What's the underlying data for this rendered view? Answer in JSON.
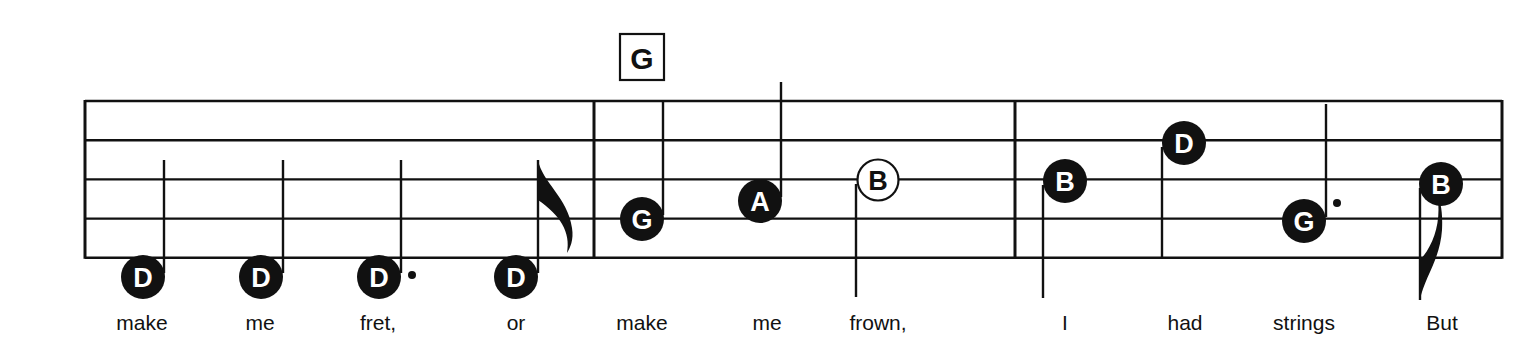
{
  "sheet": {
    "staff": {
      "top": 101,
      "spacing": 39.2,
      "lines": 5,
      "left": 85,
      "right": 1502,
      "color": "#111111"
    },
    "barlines": [
      85,
      594,
      1015,
      1502
    ],
    "chord_symbols": [
      {
        "label": "G",
        "x": 642,
        "y": 58
      }
    ],
    "notes": [
      {
        "letter": "D",
        "x": 143,
        "y": 277,
        "filled": true,
        "stem": "up",
        "stem_x": 164,
        "stem_end": 160,
        "dot": false,
        "flag": false,
        "lyric": "make",
        "lyric_x": 142
      },
      {
        "letter": "D",
        "x": 261,
        "y": 277,
        "filled": true,
        "stem": "up",
        "stem_x": 283,
        "stem_end": 160,
        "dot": false,
        "flag": false,
        "lyric": "me",
        "lyric_x": 260
      },
      {
        "letter": "D",
        "x": 379,
        "y": 277,
        "filled": true,
        "stem": "up",
        "stem_x": 401,
        "stem_end": 160,
        "dot": true,
        "flag": false,
        "lyric": "fret,",
        "lyric_x": 378
      },
      {
        "letter": "D",
        "x": 516,
        "y": 277,
        "filled": true,
        "stem": "up",
        "stem_x": 538,
        "stem_end": 160,
        "dot": false,
        "flag": true,
        "lyric": "or",
        "lyric_x": 516
      },
      {
        "letter": "G",
        "x": 642,
        "y": 219,
        "filled": true,
        "stem": "up",
        "stem_x": 663,
        "stem_end": 102,
        "dot": false,
        "flag": false,
        "lyric": "make",
        "lyric_x": 642
      },
      {
        "letter": "A",
        "x": 760,
        "y": 201,
        "filled": true,
        "stem": "up",
        "stem_x": 781,
        "stem_end": 82,
        "dot": false,
        "flag": false,
        "lyric": "me",
        "lyric_x": 767
      },
      {
        "letter": "B",
        "x": 878,
        "y": 180,
        "filled": false,
        "stem": "down",
        "stem_x": 856,
        "stem_end": 297,
        "dot": false,
        "flag": false,
        "lyric": "frown,",
        "lyric_x": 878
      },
      {
        "letter": "B",
        "x": 1065,
        "y": 181,
        "filled": true,
        "stem": "down",
        "stem_x": 1043,
        "stem_end": 298,
        "dot": false,
        "flag": false,
        "lyric": "I",
        "lyric_x": 1065
      },
      {
        "letter": "D",
        "x": 1184,
        "y": 143,
        "filled": true,
        "stem": "down",
        "stem_x": 1162,
        "stem_end": 258,
        "dot": false,
        "flag": false,
        "lyric": "had",
        "lyric_x": 1185
      },
      {
        "letter": "G",
        "x": 1304,
        "y": 221,
        "filled": true,
        "stem": "up",
        "stem_x": 1326,
        "stem_end": 104,
        "dot": true,
        "flag": false,
        "lyric": "strings",
        "lyric_x": 1304
      },
      {
        "letter": "B",
        "x": 1441,
        "y": 184,
        "filled": true,
        "stem": "down",
        "stem_x": 1420,
        "stem_end": 300,
        "dot": false,
        "flag": true,
        "lyric": "But",
        "lyric_x": 1442
      }
    ],
    "lyric_y": 330
  }
}
